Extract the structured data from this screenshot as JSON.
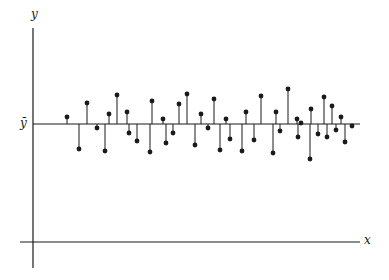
{
  "chart_data": {
    "type": "stem",
    "title": "",
    "xlabel": "x",
    "ylabel": "y",
    "reference_line_label": "ȳ",
    "ticks": {
      "x": [],
      "y": []
    },
    "grid": false,
    "legend": null,
    "baseline_pixel_y": 124,
    "points": [
      {
        "x": 67,
        "y": 7
      },
      {
        "x": 79,
        "y": -25
      },
      {
        "x": 87,
        "y": 21
      },
      {
        "x": 97,
        "y": -4
      },
      {
        "x": 105,
        "y": -27
      },
      {
        "x": 109,
        "y": 10
      },
      {
        "x": 117,
        "y": 29
      },
      {
        "x": 127,
        "y": 12
      },
      {
        "x": 129,
        "y": -9
      },
      {
        "x": 137,
        "y": -17
      },
      {
        "x": 150,
        "y": -28
      },
      {
        "x": 152,
        "y": 23
      },
      {
        "x": 163,
        "y": 5
      },
      {
        "x": 166,
        "y": -19
      },
      {
        "x": 173,
        "y": -9
      },
      {
        "x": 179,
        "y": 20
      },
      {
        "x": 187,
        "y": 30
      },
      {
        "x": 195,
        "y": -21
      },
      {
        "x": 201,
        "y": 10
      },
      {
        "x": 208,
        "y": -4
      },
      {
        "x": 214,
        "y": 25
      },
      {
        "x": 220,
        "y": -26
      },
      {
        "x": 226,
        "y": 5
      },
      {
        "x": 230,
        "y": -15
      },
      {
        "x": 242,
        "y": -27
      },
      {
        "x": 246,
        "y": 12
      },
      {
        "x": 254,
        "y": -16
      },
      {
        "x": 261,
        "y": 28
      },
      {
        "x": 273,
        "y": -29
      },
      {
        "x": 276,
        "y": 12
      },
      {
        "x": 280,
        "y": -7
      },
      {
        "x": 288,
        "y": 35
      },
      {
        "x": 297,
        "y": 5
      },
      {
        "x": 298,
        "y": -13
      },
      {
        "x": 301,
        "y": 1
      },
      {
        "x": 310,
        "y": -35
      },
      {
        "x": 311,
        "y": 15
      },
      {
        "x": 318,
        "y": -10
      },
      {
        "x": 324,
        "y": 27
      },
      {
        "x": 327,
        "y": -13
      },
      {
        "x": 332,
        "y": 18
      },
      {
        "x": 336,
        "y": -6
      },
      {
        "x": 341,
        "y": 7
      },
      {
        "x": 345,
        "y": -18
      },
      {
        "x": 352,
        "y": -2
      }
    ]
  },
  "labels": {
    "y_axis": "y",
    "x_axis": "x",
    "mean": "ȳ"
  },
  "colors": {
    "ink": "#1a1a1a",
    "background": "#ffffff"
  }
}
